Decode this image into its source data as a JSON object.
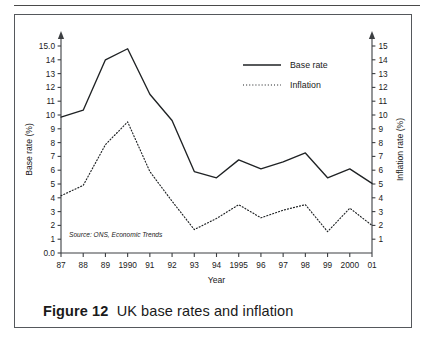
{
  "figure": {
    "number_label": "Figure 12",
    "caption_text": "UK base rates and inflation"
  },
  "source_note": "Source: ONS, Economic Trends",
  "legend": {
    "base_rate_label": "Base rate",
    "inflation_label": "Inflation"
  },
  "axes": {
    "left_title": "Base rate (%)",
    "right_title": "Inflation rate (%)",
    "x_title": "Year"
  },
  "chart_data": {
    "type": "line",
    "title": "UK base rates and inflation",
    "xlabel": "Year",
    "ylabel": "Base rate (%)",
    "y2label": "Inflation rate (%)",
    "grid": false,
    "legend_position": "top-right",
    "x": [
      "87",
      "88",
      "89",
      "1990",
      "91",
      "92",
      "93",
      "94",
      "1995",
      "96",
      "97",
      "98",
      "99",
      "2000",
      "01"
    ],
    "xtick_labels": [
      "87",
      "88",
      "89",
      "1990",
      "91",
      "92",
      "93",
      "94",
      "1995",
      "96",
      "97",
      "98",
      "99",
      "2000",
      "01"
    ],
    "left_tick_labels": [
      "0.0",
      "1",
      "2",
      "3",
      "4",
      "5",
      "6",
      "7",
      "8",
      "9",
      "10",
      "11",
      "12",
      "13",
      "14",
      "15.0"
    ],
    "right_tick_labels": [
      "1",
      "2",
      "3",
      "4",
      "5",
      "6",
      "7",
      "8",
      "9",
      "10",
      "11",
      "12",
      "13",
      "14",
      "15"
    ],
    "ylim": [
      0,
      15
    ],
    "y2lim": [
      0,
      15
    ],
    "series": [
      {
        "name": "Base rate",
        "style": "solid",
        "axis": "left",
        "values": [
          9.85,
          10.35,
          14.0,
          14.8,
          11.5,
          9.6,
          5.9,
          5.45,
          6.75,
          6.1,
          6.6,
          7.25,
          5.45,
          6.1,
          5.05
        ]
      },
      {
        "name": "Inflation",
        "style": "dotted",
        "axis": "right",
        "values": [
          4.15,
          4.9,
          7.85,
          9.5,
          5.9,
          3.75,
          1.7,
          2.5,
          3.5,
          2.55,
          3.1,
          3.5,
          1.55,
          3.25,
          2.0
        ]
      }
    ]
  }
}
